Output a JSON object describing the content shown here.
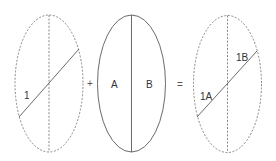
{
  "diagram": {
    "colors": {
      "line": "#5a5a5a",
      "dashed": "#7a7a7a",
      "text": "#333333"
    },
    "left_ellipse": {
      "style": "dashed",
      "label": "1"
    },
    "operator_plus": "+",
    "middle_ellipse": {
      "style": "solid",
      "left_label": "A",
      "right_label": "B"
    },
    "operator_equals": "=",
    "right_ellipse": {
      "style": "dashed",
      "upper_label": "1B",
      "lower_label": "1A"
    }
  }
}
